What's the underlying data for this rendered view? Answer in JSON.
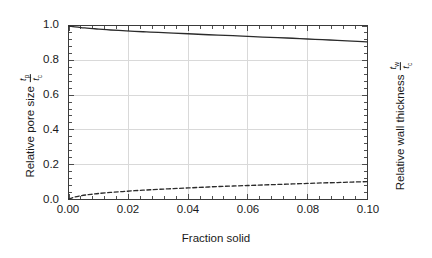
{
  "chart_data": {
    "type": "line",
    "title": "",
    "subtitle": "",
    "xlabel": "Fraction solid",
    "ylabel": "Relative pore size",
    "ylabel_right": "Relative wall thickness",
    "ylabel_fraction": {
      "numerator": "t",
      "numerator_sub": "p",
      "denominator": "t",
      "denominator_sub": "c"
    },
    "ylabel_right_fraction": {
      "numerator": "t",
      "numerator_sub": "w",
      "denominator": "t",
      "denominator_sub": "c"
    },
    "xlim": [
      0.0,
      0.1
    ],
    "ylim": [
      0.0,
      1.0
    ],
    "xticks": [
      0.0,
      0.02,
      0.04,
      0.06,
      0.08,
      0.1
    ],
    "xtick_labels": [
      "0.00",
      "0.02",
      "0.04",
      "0.06",
      "0.08",
      "0.10"
    ],
    "yticks": [
      0.0,
      0.2,
      0.4,
      0.6,
      0.8,
      1.0
    ],
    "ytick_labels": [
      "0.0",
      "0.2",
      "0.4",
      "0.6",
      "0.8",
      "1.0"
    ],
    "ytick_labels_right": [],
    "grid": true,
    "grid_color": "#d9d9d9",
    "minor_ticks_per_interval": 4,
    "legend": "none",
    "frame_color": "#3a3a3a",
    "series": [
      {
        "name": "Relative pore size",
        "style": "solid",
        "color": "#2b2b2b",
        "x": [
          0.0,
          0.002,
          0.004,
          0.006,
          0.008,
          0.01,
          0.014,
          0.018,
          0.022,
          0.026,
          0.03,
          0.035,
          0.04,
          0.045,
          0.05,
          0.055,
          0.06,
          0.065,
          0.07,
          0.075,
          0.08,
          0.085,
          0.09,
          0.095,
          0.1
        ],
        "values": [
          1.0,
          0.995,
          0.991,
          0.988,
          0.985,
          0.982,
          0.977,
          0.973,
          0.969,
          0.966,
          0.963,
          0.959,
          0.955,
          0.951,
          0.947,
          0.944,
          0.94,
          0.936,
          0.933,
          0.929,
          0.925,
          0.921,
          0.917,
          0.913,
          0.908
        ]
      },
      {
        "name": "Relative wall thickness",
        "style": "dashed",
        "color": "#2b2b2b",
        "x": [
          0.0,
          0.002,
          0.004,
          0.006,
          0.008,
          0.01,
          0.014,
          0.018,
          0.022,
          0.026,
          0.03,
          0.035,
          0.04,
          0.045,
          0.05,
          0.055,
          0.06,
          0.065,
          0.07,
          0.075,
          0.08,
          0.085,
          0.09,
          0.095,
          0.1
        ],
        "values": [
          0.0,
          0.012,
          0.019,
          0.024,
          0.028,
          0.032,
          0.038,
          0.043,
          0.048,
          0.052,
          0.056,
          0.06,
          0.064,
          0.068,
          0.072,
          0.075,
          0.078,
          0.081,
          0.084,
          0.087,
          0.09,
          0.093,
          0.095,
          0.098,
          0.1
        ]
      }
    ]
  }
}
